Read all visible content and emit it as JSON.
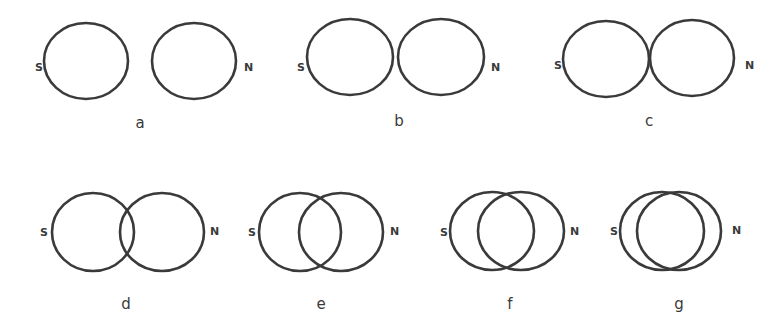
{
  "figure": {
    "stroke_color": "#3a3a3a",
    "background": "#ffffff"
  },
  "panels": [
    {
      "label": "a",
      "south": "S",
      "north": "N",
      "rings": [
        {
          "cx": 86,
          "cy": 61,
          "rx": 42,
          "ry": 38
        },
        {
          "cx": 194,
          "cy": 61,
          "rx": 42,
          "ry": 38
        }
      ],
      "s_pos": [
        35,
        71
      ],
      "n_pos": [
        244,
        71
      ],
      "label_pos": [
        140,
        128
      ]
    },
    {
      "label": "b",
      "south": "S",
      "north": "N",
      "rings": [
        {
          "cx": 350,
          "cy": 57,
          "rx": 43,
          "ry": 38
        },
        {
          "cx": 441,
          "cy": 57,
          "rx": 43,
          "ry": 38
        }
      ],
      "s_pos": [
        297,
        71
      ],
      "n_pos": [
        491,
        71
      ],
      "label_pos": [
        399,
        126
      ]
    },
    {
      "label": "c",
      "south": "S",
      "north": "N",
      "rings": [
        {
          "cx": 606,
          "cy": 59,
          "rx": 43,
          "ry": 38
        },
        {
          "cx": 692,
          "cy": 58,
          "rx": 42,
          "ry": 38
        }
      ],
      "s_pos": [
        554,
        69
      ],
      "n_pos": [
        745,
        69
      ],
      "label_pos": [
        649,
        126
      ]
    },
    {
      "label": "d",
      "south": "S",
      "north": "N",
      "rings": [
        {
          "cx": 93,
          "cy": 232,
          "rx": 41,
          "ry": 39
        },
        {
          "cx": 162,
          "cy": 232,
          "rx": 42,
          "ry": 39
        }
      ],
      "s_pos": [
        40,
        236
      ],
      "n_pos": [
        210,
        235
      ],
      "label_pos": [
        126,
        309
      ]
    },
    {
      "label": "e",
      "south": "S",
      "north": "N",
      "rings": [
        {
          "cx": 300,
          "cy": 232,
          "rx": 41,
          "ry": 39
        },
        {
          "cx": 341,
          "cy": 232,
          "rx": 42,
          "ry": 39
        }
      ],
      "s_pos": [
        248,
        236
      ],
      "n_pos": [
        390,
        235
      ],
      "label_pos": [
        321,
        309
      ]
    },
    {
      "label": "f",
      "south": "S",
      "north": "N",
      "rings": [
        {
          "cx": 492,
          "cy": 231,
          "rx": 42,
          "ry": 39
        },
        {
          "cx": 521,
          "cy": 231,
          "rx": 43,
          "ry": 39
        }
      ],
      "s_pos": [
        440,
        236
      ],
      "n_pos": [
        570,
        235
      ],
      "label_pos": [
        510,
        309
      ]
    },
    {
      "label": "g",
      "south": "S",
      "north": "N",
      "rings": [
        {
          "cx": 662,
          "cy": 231,
          "rx": 42,
          "ry": 39
        },
        {
          "cx": 679,
          "cy": 231,
          "rx": 42,
          "ry": 39
        }
      ],
      "s_pos": [
        610,
        235
      ],
      "n_pos": [
        732,
        234
      ],
      "label_pos": [
        679,
        309
      ]
    }
  ]
}
